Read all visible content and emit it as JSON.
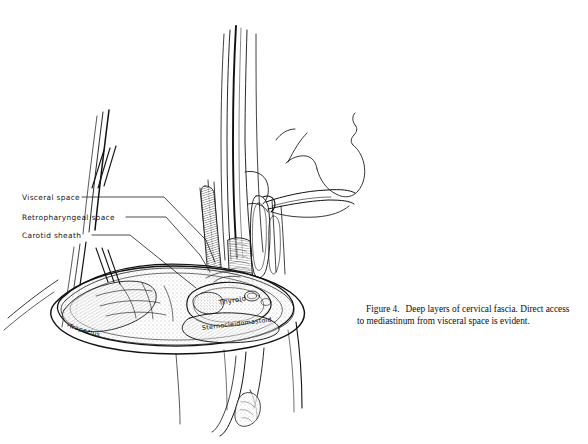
{
  "figure": {
    "background_color": "#ffffff",
    "ink_color": "#111111",
    "title_number": "Figure 4.",
    "caption_line_1": "Deep layers of cervical fascia. Direct access",
    "caption_line_2": "to mediastinum from visceral space is evident.",
    "caption_full": "Figure 4.   Deep layers of cervical fascia. Direct access to mediastinum from visceral space is evident."
  },
  "annotations": {
    "items": [
      {
        "label": "Visceral space",
        "leader": true
      },
      {
        "label": "Retropharyngeal space",
        "leader": true
      },
      {
        "label": "Carotid sheath",
        "leader": true
      }
    ]
  },
  "structures": {
    "thyroid": "Thyroid",
    "sternocleidomastoid": "Sternocleidomastoid",
    "trapezius": "Trapezius"
  }
}
